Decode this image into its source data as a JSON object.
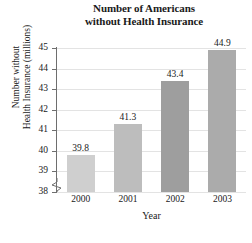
{
  "chart_data": {
    "type": "bar",
    "title": "Number of Americans without Health Insurance",
    "title_lines": [
      "Number of Americans",
      "without Health Insurance"
    ],
    "xlabel": "Year",
    "ylabel": "Number without Health Insurance (millions)",
    "ylabel_lines": [
      "Number without",
      "Health Insurance (millions)"
    ],
    "categories": [
      "2000",
      "2001",
      "2002",
      "2003"
    ],
    "values": [
      39.8,
      41.3,
      43.4,
      44.9
    ],
    "data_labels": [
      "39.8",
      "41.3",
      "43.4",
      "44.9"
    ],
    "ylim": [
      38,
      45
    ],
    "yticks": [
      45,
      44,
      43,
      42,
      41,
      40,
      39,
      38
    ],
    "ytick_labels": [
      "45",
      "44",
      "43",
      "42",
      "41",
      "40",
      "39",
      "38"
    ],
    "axis_break": true,
    "grid": true,
    "legend": "none",
    "bar_colors": [
      "#cfcfcf",
      "#bdbdbd",
      "#9e9e9e",
      "#ababab"
    ],
    "grid_color": "#e3e3e3",
    "axis_color": "#6e6e6e"
  }
}
